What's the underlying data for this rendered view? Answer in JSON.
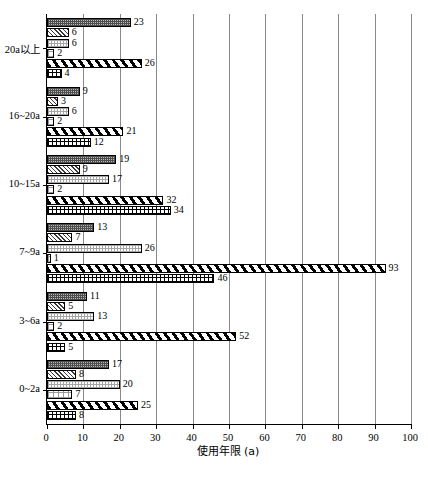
{
  "chart_data": {
    "type": "bar",
    "orientation": "horizontal",
    "title": "",
    "subtitle": "",
    "xlabel": "使用年限 (a)",
    "ylabel": "",
    "xlim": [
      0,
      100
    ],
    "xticks": [
      0,
      10,
      20,
      30,
      40,
      50,
      60,
      70,
      80,
      90,
      100
    ],
    "xtick_labels": [
      "0",
      "10",
      "20",
      "30",
      "40",
      "50",
      "60",
      "70",
      "80",
      "90",
      "100"
    ],
    "grid": true,
    "grid_axis": "x",
    "legend": false,
    "legend_position": "none",
    "categories": [
      "20a以上",
      "16~20a",
      "10~15a",
      "7~9a",
      "3~6a",
      "0~2a"
    ],
    "series": [
      {
        "name": "series-1",
        "pattern": "dense-dark-dots",
        "values": [
          23,
          9,
          19,
          13,
          11,
          17
        ]
      },
      {
        "name": "series-2",
        "pattern": "fine-diagonal-hatch",
        "values": [
          6,
          3,
          9,
          7,
          5,
          8
        ]
      },
      {
        "name": "series-3",
        "pattern": "light-dots",
        "values": [
          6,
          6,
          17,
          26,
          13,
          20
        ]
      },
      {
        "name": "series-4",
        "pattern": "sparse-dots",
        "values": [
          2,
          2,
          2,
          1,
          2,
          7
        ]
      },
      {
        "name": "series-5",
        "pattern": "bold-diagonal-stripes",
        "values": [
          26,
          21,
          32,
          93,
          52,
          25
        ]
      },
      {
        "name": "series-6",
        "pattern": "crosshatch-grid",
        "values": [
          4,
          12,
          34,
          46,
          5,
          8
        ]
      }
    ],
    "colors": {
      "axis": "#000000",
      "gridline": "#8a8a8a",
      "bar_outline": "#000000",
      "background": "#ffffff",
      "text": "#000000"
    }
  }
}
